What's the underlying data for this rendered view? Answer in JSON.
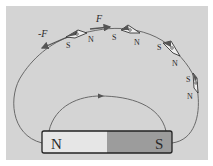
{
  "diagram": {
    "colors": {
      "background": "#d4d4d4",
      "field_line": "#6a6a6a",
      "north_half": "#e6e6e6",
      "south_half": "#9c9c9c",
      "outline": "#222222"
    },
    "magnet": {
      "north_label": "N",
      "south_label": "S"
    },
    "forces": {
      "force_label": "F",
      "neg_force_label": "-F"
    },
    "compasses": [
      {
        "s": "S",
        "n": "N"
      },
      {
        "s": "S",
        "n": "N"
      },
      {
        "s": "S",
        "n": "N"
      },
      {
        "s": "S",
        "n": "N"
      }
    ]
  }
}
